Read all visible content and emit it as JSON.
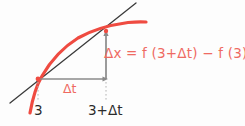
{
  "figure": {
    "colors": {
      "curve": "#ef4b41",
      "secant_line": "#3b3b3b",
      "arrow": "#8a8a8a",
      "dotted_guide": "#b4b4b4",
      "formula_text": "#ef6a62",
      "tick_text": "#2b2b2b",
      "background": "#fdfdfd"
    },
    "labels": {
      "formula": "Δx = f (3+Δt) − f (3)",
      "delta_t": "Δt",
      "tick_a": "3",
      "tick_b": "3+Δt"
    },
    "geometry": {
      "point_a": [
        38,
        79
      ],
      "point_b": [
        106,
        31
      ],
      "secant_start": [
        10,
        103
      ],
      "secant_end": [
        136,
        3
      ],
      "curve_start": [
        30,
        113
      ],
      "curve_end": [
        146,
        22
      ],
      "horizontal_arrow": {
        "from": [
          38,
          79
        ],
        "to": [
          108,
          79
        ]
      },
      "vertical_arrow": {
        "from": [
          106,
          79
        ],
        "to": [
          106,
          31
        ]
      },
      "dotted_a": {
        "x": 38,
        "from_y": 82,
        "to_y": 102
      },
      "dotted_b": {
        "x": 106,
        "from_y": 82,
        "to_y": 102
      }
    }
  }
}
